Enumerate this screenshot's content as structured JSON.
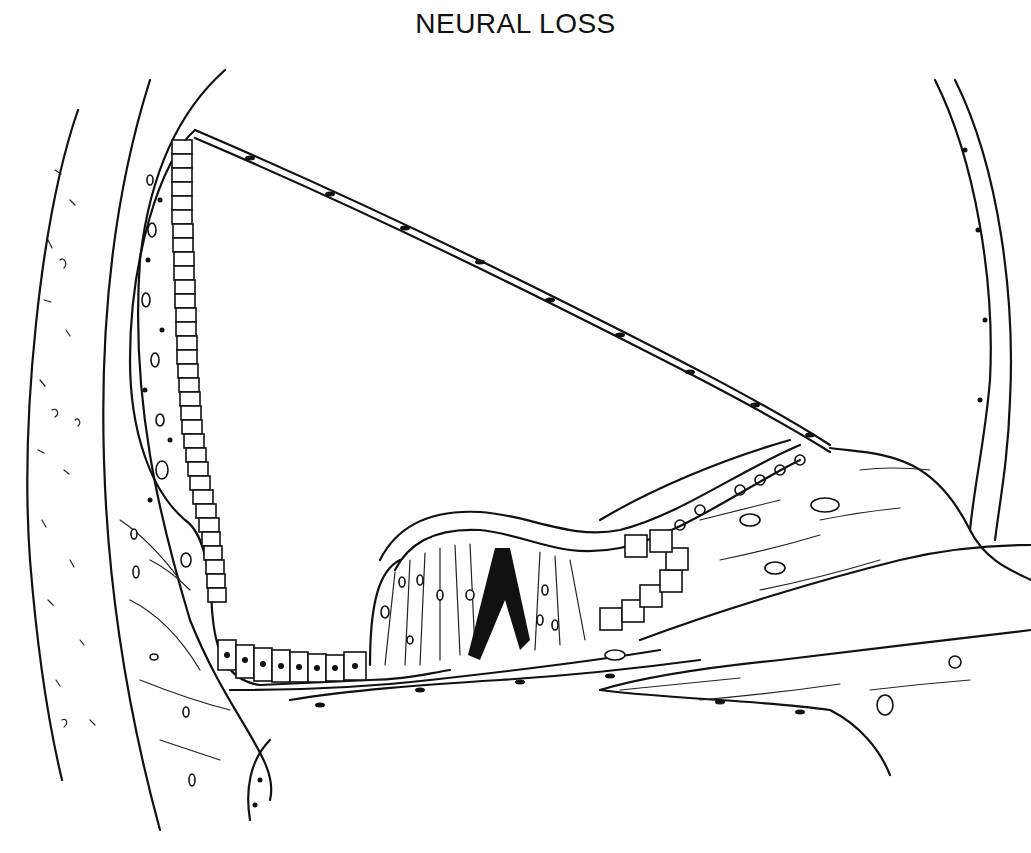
{
  "figure": {
    "title": "NEURAL LOSS"
  },
  "colors": {
    "ink": "#111111",
    "background": "#ffffff"
  }
}
